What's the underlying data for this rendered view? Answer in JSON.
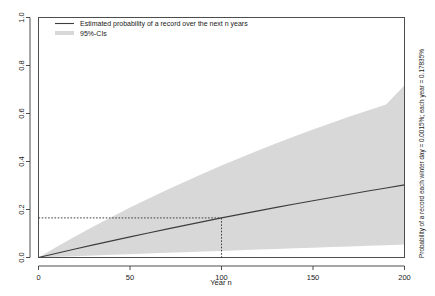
{
  "chart_data": {
    "type": "line",
    "title": "",
    "xlabel": "Year n",
    "ylabel": "",
    "right_label": "Probability of a record each winter day = 0.0015%; each year = 0.17835%",
    "xlim": [
      0,
      200
    ],
    "ylim": [
      0,
      1
    ],
    "xticks": [
      0,
      50,
      100,
      150,
      200
    ],
    "xticklabels": [
      "0",
      "50",
      "100",
      "150",
      "200"
    ],
    "yticks": [
      0.0,
      0.2,
      0.4,
      0.6,
      0.8,
      1.0
    ],
    "yticklabels": [
      "0.0",
      "0.2",
      "0.4",
      "0.6",
      "0.8",
      "1.0"
    ],
    "grid": false,
    "legend_position": "top-left",
    "legend": [
      {
        "label": "Estimated probability of a record over the next n years",
        "type": "line",
        "color": "#3d3d3d"
      },
      {
        "label": "95%-CIs",
        "type": "band",
        "color": "#d8d8d8"
      }
    ],
    "annotations": [
      {
        "type": "reference-lines",
        "style": "dotted",
        "x": 100,
        "y": 0.165,
        "color": "#3d3d3d"
      }
    ],
    "x": [
      0,
      10,
      20,
      30,
      40,
      50,
      60,
      70,
      80,
      90,
      100,
      110,
      120,
      130,
      140,
      150,
      160,
      170,
      180,
      190,
      200
    ],
    "series": [
      {
        "name": "Estimated probability of a record over the next n years",
        "color": "#3d3d3d",
        "values": [
          0.0,
          0.0178,
          0.0353,
          0.0525,
          0.0694,
          0.086,
          0.1023,
          0.1183,
          0.134,
          0.1495,
          0.165,
          0.1797,
          0.1943,
          0.2087,
          0.2228,
          0.2367,
          0.2503,
          0.2637,
          0.2769,
          0.2899,
          0.3026
        ]
      },
      {
        "name": "95%-CI upper",
        "color": "#d8d8d8",
        "values": [
          0.0,
          0.045,
          0.088,
          0.129,
          0.169,
          0.208,
          0.245,
          0.281,
          0.316,
          0.35,
          0.383,
          0.415,
          0.446,
          0.476,
          0.505,
          0.533,
          0.56,
          0.587,
          0.613,
          0.638,
          0.718
        ]
      },
      {
        "name": "95%-CI lower",
        "color": "#d8d8d8",
        "values": [
          0.0,
          0.0028,
          0.0056,
          0.0084,
          0.0112,
          0.014,
          0.0167,
          0.0195,
          0.0222,
          0.0249,
          0.0276,
          0.0303,
          0.033,
          0.0357,
          0.0383,
          0.041,
          0.0436,
          0.0462,
          0.0488,
          0.0514,
          0.054
        ]
      }
    ]
  }
}
